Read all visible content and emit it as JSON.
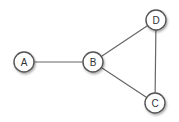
{
  "diagram": {
    "type": "undirected-graph",
    "nodes": [
      {
        "id": "A",
        "label": "A",
        "x": 24,
        "y": 62
      },
      {
        "id": "B",
        "label": "B",
        "x": 93,
        "y": 62
      },
      {
        "id": "D",
        "label": "D",
        "x": 156,
        "y": 20
      },
      {
        "id": "C",
        "label": "C",
        "x": 155,
        "y": 103
      }
    ],
    "edges": [
      {
        "from": "A",
        "to": "B"
      },
      {
        "from": "B",
        "to": "D"
      },
      {
        "from": "B",
        "to": "C"
      },
      {
        "from": "D",
        "to": "C"
      }
    ],
    "colors": {
      "edge": "#666666",
      "node_stroke": "#555555",
      "node_fill": "#ffffff",
      "label": "#333333"
    }
  }
}
